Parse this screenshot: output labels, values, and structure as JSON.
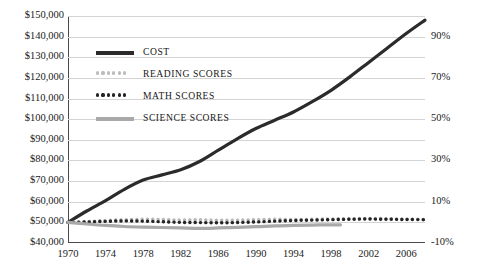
{
  "chart_data": {
    "type": "line",
    "title": "",
    "xlabel": "",
    "ylabel": "",
    "y2label": "",
    "grid": true,
    "legend_position": "inside-top-left",
    "xlim": [
      1970,
      2008
    ],
    "ylim": [
      40000,
      150000
    ],
    "y2lim": [
      -10,
      100
    ],
    "x_ticks": [
      1970,
      1974,
      1978,
      1982,
      1986,
      1990,
      1994,
      1998,
      2002,
      2006
    ],
    "y_ticks": [
      "$40,000",
      "$50,000",
      "$60,000",
      "$70,000",
      "$80,000",
      "$90,000",
      "$100,000",
      "$110,000",
      "$120,000",
      "$130,000",
      "$140,000",
      "$150,000"
    ],
    "y_tick_values": [
      40000,
      50000,
      60000,
      70000,
      80000,
      90000,
      100000,
      110000,
      120000,
      130000,
      140000,
      150000
    ],
    "y2_ticks": [
      "-10%",
      "10%",
      "30%",
      "50%",
      "70%",
      "90%"
    ],
    "y2_tick_values": [
      -10,
      10,
      30,
      50,
      70,
      90
    ],
    "series": [
      {
        "name": "COST",
        "color": "#2b2b2b",
        "style": "solid",
        "width": 3.2,
        "axis": "left",
        "x": [
          1970,
          1972,
          1974,
          1976,
          1978,
          1980,
          1982,
          1984,
          1986,
          1988,
          1990,
          1992,
          1994,
          1996,
          1998,
          2000,
          2002,
          2004,
          2006,
          2008
        ],
        "values": [
          50000,
          55500,
          60500,
          66000,
          70500,
          73000,
          75500,
          79500,
          85000,
          90500,
          95500,
          99500,
          103500,
          108500,
          114000,
          120500,
          127500,
          134500,
          141500,
          148000
        ]
      },
      {
        "name": "READING SCORES",
        "color": "#b7b7b7",
        "style": "dotted",
        "width": 3.4,
        "axis": "left",
        "x": [
          1970,
          1972,
          1974,
          1976,
          1978,
          1980,
          1982,
          1984,
          1986,
          1988,
          1990,
          1992,
          1994,
          1996,
          1998,
          2000,
          2002,
          2004,
          2006,
          2008
        ],
        "values": [
          50000,
          50400,
          50900,
          51300,
          51500,
          51400,
          51100,
          51300,
          51000,
          51100,
          51300,
          51500,
          51400,
          51500,
          51700,
          51800,
          51900,
          51800,
          51600,
          51400
        ]
      },
      {
        "name": "MATH SCORES",
        "color": "#242424",
        "style": "dotted",
        "width": 3.4,
        "axis": "left",
        "x": [
          1970,
          1972,
          1974,
          1976,
          1978,
          1980,
          1982,
          1984,
          1986,
          1988,
          1990,
          1992,
          1994,
          1996,
          1998,
          2000,
          2002,
          2004,
          2006,
          2008
        ],
        "values": [
          50000,
          50200,
          50500,
          50700,
          50600,
          50300,
          50000,
          49900,
          49800,
          49900,
          50200,
          50600,
          50900,
          51100,
          51300,
          51500,
          51600,
          51500,
          51400,
          51300
        ]
      },
      {
        "name": "SCIENCE SCORES",
        "color": "#a9a9a9",
        "style": "solid",
        "width": 3.2,
        "axis": "left",
        "x": [
          1970,
          1972,
          1974,
          1976,
          1978,
          1980,
          1982,
          1984,
          1986,
          1988,
          1990,
          1992,
          1994,
          1996,
          1998,
          1999
        ],
        "values": [
          50000,
          49200,
          48500,
          48000,
          47700,
          47500,
          47300,
          47100,
          47300,
          47600,
          47900,
          48300,
          48500,
          48700,
          48800,
          48800
        ]
      }
    ]
  },
  "legend": {
    "items": [
      {
        "label": "COST",
        "marker": "solid",
        "color": "#2b2b2b"
      },
      {
        "label": "READING SCORES",
        "marker": "dotted",
        "color": "#bcbcbc"
      },
      {
        "label": "MATH SCORES",
        "marker": "dotted",
        "color": "#242424"
      },
      {
        "label": "SCIENCE SCORES",
        "marker": "solid",
        "color": "#a9a9a9"
      }
    ]
  },
  "axes": {
    "left_labels": [
      "$150,000",
      "$140,000",
      "$130,000",
      "$120,000",
      "$110,000",
      "$100,000",
      "$90,000",
      "$80,000",
      "$70,000",
      "$60,000",
      "$50,000",
      "$40,000"
    ],
    "right_labels": [
      "90%",
      "70%",
      "50%",
      "30%",
      "10%",
      "-10%"
    ],
    "x_labels": [
      "1970",
      "1974",
      "1978",
      "1982",
      "1986",
      "1990",
      "1994",
      "1998",
      "2002",
      "2006"
    ]
  }
}
